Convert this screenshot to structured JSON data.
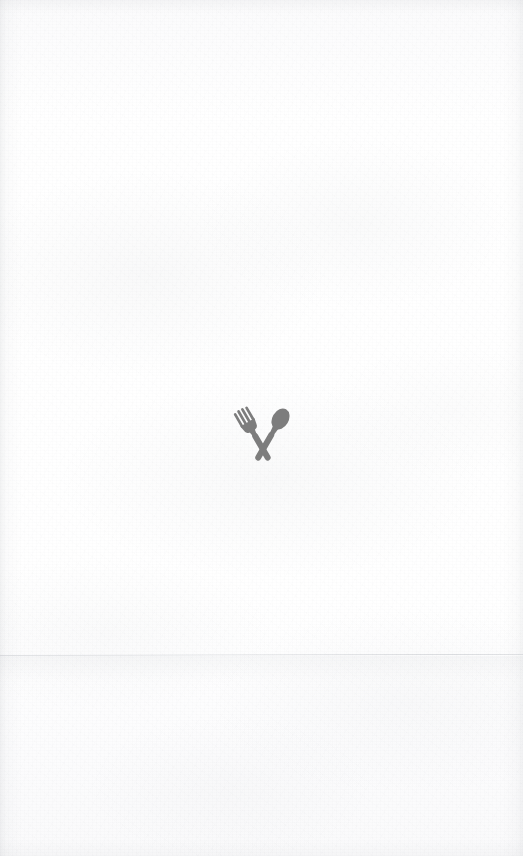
{
  "page": {
    "kind": "blank-menu-page",
    "title": "",
    "background_color": "#fdfdfd",
    "paper_tint": "#fafafb",
    "width": 523,
    "height": 856,
    "body_text": "",
    "visible_text_content": []
  },
  "logo": {
    "icon_name": "fork-and-spoon-crossed-icon",
    "label": "",
    "color": "#7d7d7d",
    "center_x": 257,
    "center_y": 432,
    "width": 62,
    "height": 66
  },
  "texture": {
    "fold_line_label": "",
    "fold_line_color": "#b0b4ba",
    "fold_line_y": 654,
    "edge_shade_color": "#969ba0"
  },
  "accessibility": {
    "logo_alt": "Crossed fork and spoon"
  }
}
